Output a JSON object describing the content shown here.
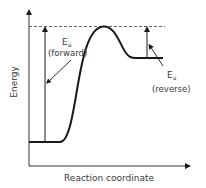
{
  "diagram": {
    "type": "energy-profile",
    "axes": {
      "y_label": "Energy",
      "x_label": "Reaction coordinate"
    },
    "annotations": {
      "forward": {
        "symbol": "E",
        "subscript": "a",
        "caption": "(forward)"
      },
      "reverse": {
        "symbol": "E",
        "subscript": "a",
        "caption": "(reverse)"
      }
    },
    "colors": {
      "line": "#1a1a1a",
      "text": "#3a3a3a",
      "dashed": "#555555"
    }
  }
}
